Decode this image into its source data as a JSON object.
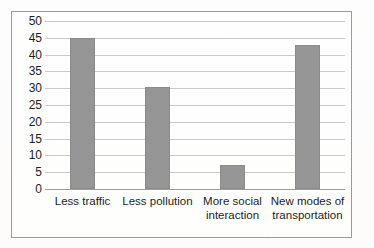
{
  "chart_data": {
    "type": "bar",
    "title": "",
    "subtitle": "",
    "xlabel": "",
    "ylabel": "",
    "categories": [
      "Less traffic",
      "Less pollution",
      "More social interaction",
      "New modes of transportation"
    ],
    "values": [
      45,
      30.5,
      7,
      43
    ],
    "ylim": [
      0,
      50
    ],
    "ytick_labels": [
      "50",
      "45",
      "40",
      "35",
      "30",
      "25",
      "20",
      "15",
      "10",
      "5",
      "0"
    ],
    "ytick_values": [
      50,
      45,
      40,
      35,
      30,
      25,
      20,
      15,
      10,
      5,
      0
    ],
    "grid": true,
    "legend": false,
    "legend_position": "none",
    "bar_color": "#969696",
    "bar_edge_color": "#8a8a8a",
    "gridline_color": "#c9c9c9",
    "axis_color": "#9d9d9d",
    "frame_color": "#9a9a9a",
    "text_color": "#1d1d1d"
  },
  "frame": {
    "border_color": "#9a9a9a",
    "background": "#fdfdfd"
  }
}
